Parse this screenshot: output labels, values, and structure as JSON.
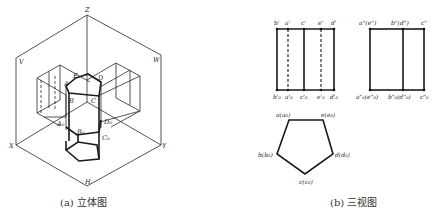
{
  "figure_a": {
    "caption": "(a) 立体图",
    "axis_labels": {
      "z": "Z",
      "v": "V",
      "w": "W",
      "x": "X",
      "y": "Y",
      "h": "H"
    },
    "point_labels": {
      "e": "E",
      "a": "A",
      "d": "D",
      "b": "B",
      "c": "C",
      "a0": "A₀",
      "b0": "B₀",
      "c0": "C₀",
      "d0": "D₀"
    }
  },
  "figure_b": {
    "caption": "(b) 三视图",
    "front_view": {
      "top_labels": [
        "b'",
        "a'",
        "c'",
        "e'",
        "d'"
      ],
      "bottom_labels": [
        "b'₀",
        "a'₀",
        "c'₀",
        "e'₀",
        "d'₀"
      ],
      "dashed_lines": [
        "a'",
        "e'"
      ]
    },
    "side_view": {
      "top_labels": [
        "a\"(e\")",
        "b\"(d\")",
        "c\""
      ],
      "bottom_labels": [
        "a\"₀(e\"₀)",
        "b\"₀(d\"₀)",
        "c\"₀"
      ]
    },
    "top_view": {
      "vertex_labels": [
        "a(a₀)",
        "e(e₀)",
        "d(d₀)",
        "c(c₀)",
        "b(b₀)"
      ]
    }
  }
}
